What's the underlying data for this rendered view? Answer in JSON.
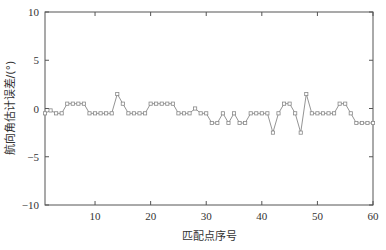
{
  "chart_data": {
    "type": "line",
    "title": "",
    "xlabel": "匹配点序号",
    "ylabel": "航向角估计误差/(°)",
    "xlim": [
      1,
      60
    ],
    "ylim": [
      -10,
      10
    ],
    "xticks": [
      10,
      20,
      30,
      40,
      50,
      60
    ],
    "yticks": [
      -10,
      -5,
      0,
      5,
      10
    ],
    "xtick_labels": [
      "10",
      "20",
      "30",
      "40",
      "50",
      "60"
    ],
    "ytick_labels": [
      "−10",
      "−5",
      "0",
      "5",
      "10"
    ],
    "grid": false,
    "legend": null,
    "series": [
      {
        "name": "航向角估计误差",
        "color": "#888888",
        "marker": "square",
        "x": [
          1,
          2,
          3,
          4,
          5,
          6,
          7,
          8,
          9,
          10,
          11,
          12,
          13,
          14,
          15,
          16,
          17,
          18,
          19,
          20,
          21,
          22,
          23,
          24,
          25,
          26,
          27,
          28,
          29,
          30,
          31,
          32,
          33,
          34,
          35,
          36,
          37,
          38,
          39,
          40,
          41,
          42,
          43,
          44,
          45,
          46,
          47,
          48,
          49,
          50,
          51,
          52,
          53,
          54,
          55,
          56,
          57,
          58,
          59,
          60
        ],
        "values": [
          -0.5,
          -0.2,
          -0.5,
          -0.5,
          0.5,
          0.5,
          0.5,
          0.5,
          -0.5,
          -0.5,
          -0.5,
          -0.5,
          -0.5,
          1.5,
          0.5,
          -0.5,
          -0.5,
          -0.5,
          -0.5,
          0.5,
          0.5,
          0.5,
          0.5,
          0.5,
          -0.5,
          -0.5,
          -0.5,
          0,
          -0.5,
          -0.5,
          -1.5,
          -1.5,
          -0.5,
          -1.5,
          -0.5,
          -1.5,
          -1.5,
          -0.5,
          -0.5,
          -0.5,
          -0.5,
          -2.5,
          -0.5,
          0.5,
          0.5,
          -0.5,
          -2.5,
          1.5,
          -0.5,
          -0.5,
          -0.5,
          -0.5,
          -0.5,
          0.5,
          0.5,
          -0.5,
          -1.5,
          -1.5,
          -1.5,
          -1.5
        ]
      }
    ]
  },
  "plot": {
    "left": 45,
    "top": 12,
    "right": 373,
    "bottom": 205,
    "axis_color": "#555555",
    "line_color": "#888888"
  }
}
